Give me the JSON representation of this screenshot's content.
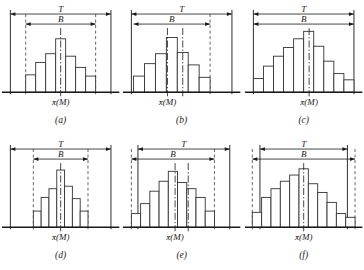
{
  "figure": {
    "axis_label": "x̄(M)",
    "tolerance_label": "T",
    "spread_label": "B",
    "colors": {
      "ink": "#1a1a1a",
      "background": "#ffffff",
      "bar_stroke": "#333333",
      "dashed": "#555555"
    }
  },
  "chart_data": {
    "type": "bar",
    "xlabel": "x̄(M)",
    "ylabel": "",
    "grid": false,
    "legend": "none",
    "annotations": [
      "T",
      "B"
    ],
    "panels": [
      {
        "id": "a",
        "caption": "(a)",
        "axis_label": "x̄(M)",
        "tolerance_label": "T",
        "spread_label": "B",
        "values": [
          28,
          48,
          62,
          86,
          58,
          40,
          26
        ],
        "ymax": 100,
        "t_left": 0.04,
        "t_right": 0.96,
        "b_left": 0.18,
        "b_right": 0.82,
        "b_left_dashed": true,
        "b_right_dashed": true,
        "center_lines": [
          0.5
        ],
        "bar_start": 0.18,
        "bar_end": 0.82
      },
      {
        "id": "b",
        "caption": "(b)",
        "axis_label": "x̄(M)",
        "tolerance_label": "T",
        "spread_label": "B",
        "values": [
          26,
          46,
          62,
          88,
          64,
          44,
          24
        ],
        "ymax": 100,
        "t_left": 0.04,
        "t_right": 0.96,
        "b_left": 0.06,
        "b_right": 0.76,
        "b_left_dashed": false,
        "b_right_dashed": true,
        "center_lines": [
          0.37,
          0.51
        ],
        "bar_start": 0.06,
        "bar_end": 0.76
      },
      {
        "id": "c",
        "caption": "(c)",
        "axis_label": "x̄(M)",
        "tolerance_label": "T",
        "spread_label": "B",
        "values": [
          22,
          42,
          58,
          72,
          86,
          98,
          74,
          50,
          30,
          20
        ],
        "ymax": 100,
        "t_left": 0.04,
        "t_right": 0.96,
        "b_left": 0.04,
        "b_right": 0.96,
        "b_left_dashed": false,
        "b_right_dashed": false,
        "center_lines": [
          0.55
        ],
        "bar_start": 0.04,
        "bar_end": 0.96
      },
      {
        "id": "d",
        "caption": "(d)",
        "axis_label": "x̄(M)",
        "tolerance_label": "T",
        "spread_label": "B",
        "values": [
          26,
          48,
          62,
          92,
          66,
          46,
          26
        ],
        "ymax": 100,
        "t_left": 0.04,
        "t_right": 0.96,
        "b_left": 0.25,
        "b_right": 0.75,
        "b_left_dashed": true,
        "b_right_dashed": true,
        "center_lines": [
          0.5
        ],
        "bar_start": 0.25,
        "bar_end": 0.75
      },
      {
        "id": "e",
        "caption": "(e)",
        "axis_label": "x̄(M)",
        "tolerance_label": "T",
        "spread_label": "B",
        "values": [
          22,
          38,
          58,
          74,
          90,
          72,
          62,
          48,
          26
        ],
        "ymax": 100,
        "t_left": 0.1,
        "t_right": 0.94,
        "b_left": 0.04,
        "b_right": 0.8,
        "b_left_dashed": true,
        "b_right_dashed": true,
        "center_lines": [
          0.44,
          0.56
        ],
        "bar_start": 0.04,
        "bar_end": 0.8
      },
      {
        "id": "f",
        "caption": "(f)",
        "axis_label": "x̄(M)",
        "tolerance_label": "T",
        "spread_label": "B",
        "values": [
          24,
          48,
          62,
          74,
          84,
          94,
          70,
          56,
          40,
          22,
          16
        ],
        "ymax": 100,
        "t_left": 0.1,
        "t_right": 0.9,
        "b_left": 0.03,
        "b_right": 0.97,
        "b_left_dashed": true,
        "b_right_dashed": true,
        "center_lines": [
          0.5
        ],
        "bar_start": 0.03,
        "bar_end": 0.97
      }
    ]
  }
}
